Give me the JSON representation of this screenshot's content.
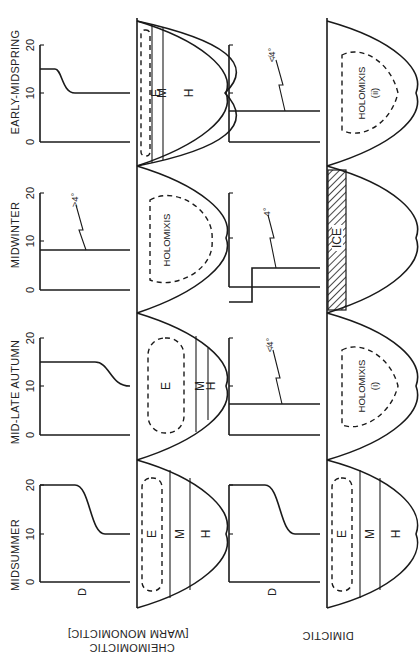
{
  "figure": {
    "orientation": "rotated-90-ccw",
    "rows": [
      {
        "label": "CHEIMOMICTIC",
        "sublabel": "[WARM MONOMICTIC]"
      },
      {
        "label": "DIMICTIC"
      }
    ],
    "seasons": [
      "MIDSUMMER",
      "MID-LATE AUTUMN",
      "MIDWINTER",
      "EARLY-MIDSPRING"
    ],
    "axis": {
      "ticks": [
        "0",
        "10",
        "20"
      ],
      "depth_label": "D"
    },
    "zones": {
      "epilimnion": "E",
      "metalimnion": "M",
      "hypolimnion": "H"
    },
    "annotations": {
      "not_4": "≮4°",
      "gt_4": ">4°",
      "eq_4": "4°",
      "holomixis": "HOLOMIXIS",
      "holomixis_i": "(i)",
      "holomixis_ii": "(ii)",
      "ice": "ICE"
    }
  }
}
